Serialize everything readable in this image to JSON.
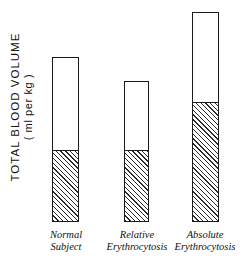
{
  "chart_data": {
    "type": "bar",
    "title": "",
    "subtitle": "",
    "xlabel": "",
    "ylabel": "TOTAL BLOOD VOLUME",
    "ylabel_units": "( ml per kg )",
    "grid": false,
    "legend": "none",
    "axis_visible": false,
    "ylim": [
      0,
      100
    ],
    "categories": [
      "Normal Subject",
      "Relative Erythrocytosis",
      "Absolute Erythrocytosis"
    ],
    "category_lines": [
      [
        "Normal",
        "Subject"
      ],
      [
        "Relative",
        "Erythrocytosis"
      ],
      [
        "Absolute",
        "Erythrocytosis"
      ]
    ],
    "series": [
      {
        "name": "Red cell mass (hatched)",
        "style": "hatched",
        "values": [
          43,
          43,
          72
        ]
      },
      {
        "name": "Plasma volume (open)",
        "style": "open",
        "values": [
          57,
          42,
          55
        ]
      }
    ],
    "total_values": [
      100,
      85,
      127
    ],
    "annotations": []
  },
  "axis": {
    "y_title": "TOTAL BLOOD VOLUME",
    "y_units": "( ml per kg )"
  },
  "bars": [
    {
      "id": "bar-normal-subject",
      "label_line1": "Normal",
      "label_line2": "Subject",
      "total": 100,
      "hatched": 43
    },
    {
      "id": "bar-relative-erythrocytosis",
      "label_line1": "Relative",
      "label_line2": "Erythrocytosis",
      "total": 85,
      "hatched": 43
    },
    {
      "id": "bar-absolute-erythrocytosis",
      "label_line1": "Absolute",
      "label_line2": "Erythrocytosis",
      "total": 127,
      "hatched": 72
    }
  ],
  "colors": {
    "outline": "#1a1a1a",
    "hatch": "#2b2b2b",
    "open_fill": "#ffffff",
    "background": "#ffffff",
    "text": "#111111"
  }
}
